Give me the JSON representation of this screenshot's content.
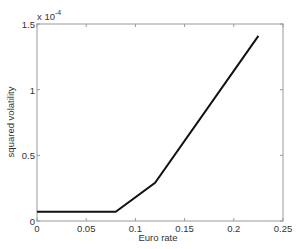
{
  "chart_data": {
    "type": "line",
    "title": "",
    "xlabel": "Euro rate",
    "ylabel": "squared volatility",
    "y_multiplier": "x 10^-4",
    "xlim": [
      0,
      0.25
    ],
    "ylim": [
      0,
      1.5
    ],
    "xticks": [
      "0",
      "0.05",
      "0.1",
      "0.15",
      "0.2",
      "0.25"
    ],
    "yticks": [
      "0",
      "0.5",
      "1",
      "1.5"
    ],
    "grid": false,
    "legend": null,
    "series": [
      {
        "name": "squared volatility",
        "color": "#111111",
        "x": [
          0,
          0.08,
          0.12,
          0.225
        ],
        "y": [
          0.07,
          0.07,
          0.29,
          1.41
        ]
      }
    ]
  },
  "labels": {
    "xlabel": "Euro rate",
    "ylabel": "squared volatility",
    "exponent_base": "x 10",
    "exponent_power": "-4"
  }
}
